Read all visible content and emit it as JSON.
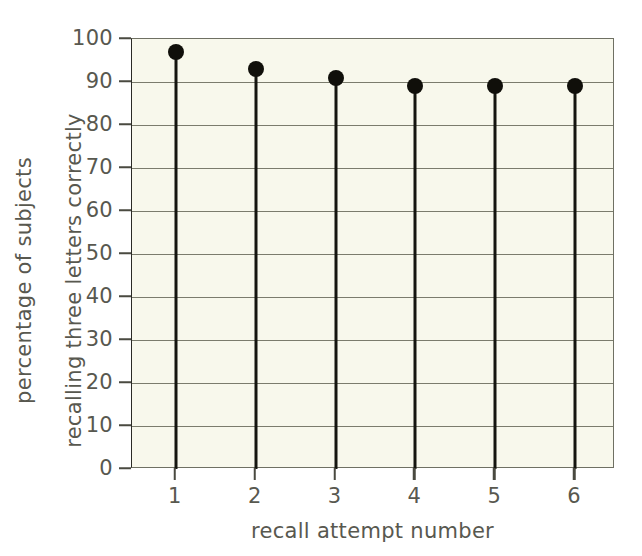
{
  "chart_data": {
    "type": "scatter",
    "title": "",
    "subtitle": "",
    "xlabel": "recall attempt number",
    "ylabel": "percentage of subjects recalling three letters correctly",
    "ylabel_line1": "percentage of subjects",
    "ylabel_line2": "recalling three letters correctly",
    "categories": [
      "1",
      "2",
      "3",
      "4",
      "5",
      "6"
    ],
    "x": [
      1,
      2,
      3,
      4,
      5,
      6
    ],
    "values": [
      97,
      93,
      91,
      89,
      89,
      89
    ],
    "series": [
      {
        "name": "percentage recalling three letters correctly",
        "values": [
          97,
          93,
          91,
          89,
          89,
          89
        ]
      }
    ],
    "xlim": [
      0.45,
      6.5
    ],
    "ylim": [
      0,
      100
    ],
    "y_ticks": [
      0,
      10,
      20,
      30,
      40,
      50,
      60,
      70,
      80,
      90,
      100
    ],
    "y_tick_labels": [
      "0",
      "10",
      "20",
      "30",
      "40",
      "50",
      "60",
      "70",
      "80",
      "90",
      "100"
    ],
    "x_ticks": [
      1,
      2,
      3,
      4,
      5,
      6
    ],
    "x_tick_labels": [
      "1",
      "2",
      "3",
      "4",
      "5",
      "6"
    ],
    "grid": "horizontal",
    "legend": "none",
    "marker_style": "filled-circle-with-stem",
    "colors": {
      "plot_background": "#f8f8ec",
      "page_background": "#ffffff",
      "gridline": "#7b7c6d",
      "axis": "#4a4a40",
      "marker": "#100f0a",
      "stem": "#15150f",
      "tick_text": "#58584f"
    }
  }
}
